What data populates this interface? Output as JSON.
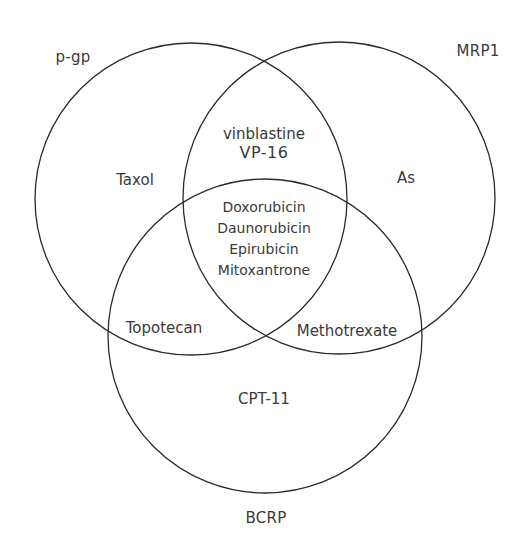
{
  "diagram": {
    "type": "venn-3",
    "stroke_color": "#2b2b2b",
    "text_color": "#3a3a3a",
    "sets": [
      {
        "id": "pgp",
        "label": "p-gp",
        "cx": 191,
        "cy": 199,
        "r": 156
      },
      {
        "id": "mrp1",
        "label": "MRP1",
        "cx": 339,
        "cy": 198,
        "r": 156
      },
      {
        "id": "bcrp",
        "label": "BCRP",
        "cx": 265,
        "cy": 336,
        "r": 157
      }
    ],
    "regions": {
      "pgp_only": [
        "Taxol"
      ],
      "mrp1_only": [
        "As"
      ],
      "bcrp_only": [
        "CPT-11"
      ],
      "pgp_mrp1": [
        "vinblastine",
        "VP-16"
      ],
      "pgp_bcrp": [
        "Topotecan"
      ],
      "mrp1_bcrp": [
        "Methotrexate"
      ],
      "all_three": [
        "Doxorubicin",
        "Daunorubicin",
        "Epirubicin",
        "Mitoxantrone"
      ]
    }
  }
}
